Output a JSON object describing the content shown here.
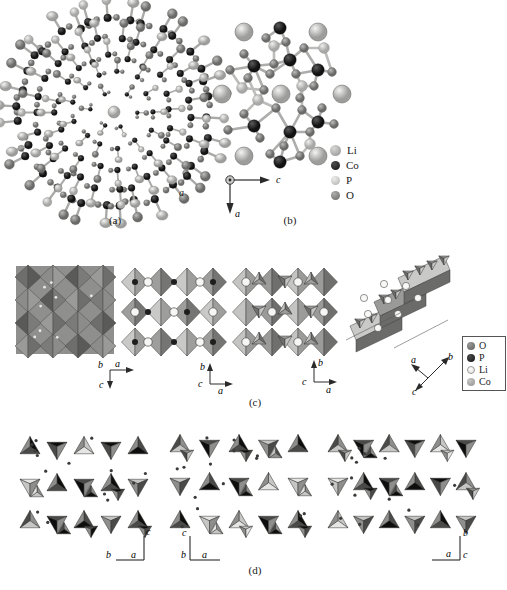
{
  "figure": {
    "background": "#ffffff"
  },
  "palette": {
    "li": "#e8e8e6",
    "co": "#2b2b2b",
    "p": "#b9b9b7",
    "o": "#8a8a88",
    "poly_light": "#cfcfcd",
    "poly_mid": "#9e9e9c",
    "poly_dark": "#6e6e6c",
    "poly_black": "#111111",
    "outline": "#4a4a4a",
    "bond": "#9a9a98",
    "text": "#1a1a1a"
  },
  "panels": [
    {
      "id": "a",
      "caption": "(a)"
    },
    {
      "id": "b",
      "caption": "(b)"
    },
    {
      "id": "c",
      "caption": "(c)"
    },
    {
      "id": "d",
      "caption": "(d)"
    }
  ],
  "legend_b": {
    "items": [
      {
        "label": "Li",
        "color": "#a8a8a6",
        "size": 11
      },
      {
        "label": "Co",
        "color": "#1f1f1f",
        "size": 9
      },
      {
        "label": "P",
        "color": "#c2c2c0",
        "size": 8
      },
      {
        "label": "O",
        "color": "#7d7d7b",
        "size": 8
      }
    ]
  },
  "legend_c": {
    "items": [
      {
        "label": "O",
        "color": "#6f6f6d",
        "size": 8
      },
      {
        "label": "P",
        "color": "#262626",
        "size": 8
      },
      {
        "label": "Li",
        "color": "#f2f2f0",
        "size": 8
      },
      {
        "label": "Co",
        "color": "#a7a7a5",
        "size": 8
      }
    ]
  },
  "axes": {
    "panel_b": {
      "origin": "dot",
      "right": "c",
      "down": "a"
    },
    "panel_c_1": {
      "up_left": "b",
      "right": "a",
      "down": "c"
    },
    "panel_c_2": {
      "up": "b",
      "right": "a",
      "origin": "c"
    },
    "panel_c_3": {
      "up": "b",
      "right": "a",
      "origin": "c"
    },
    "panel_c_4": {
      "up_right": "b",
      "up_left": "a",
      "down_left": "c"
    },
    "panel_d_1": {
      "up": "c",
      "right": "a",
      "origin": "b"
    },
    "panel_d_2": {
      "up": "c",
      "right": "a",
      "origin": "b"
    },
    "panel_d_3": {
      "up_right": "b",
      "left": "a",
      "down_right": "c"
    }
  }
}
